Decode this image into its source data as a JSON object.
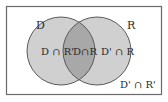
{
  "diagram": {
    "type": "venn",
    "sets": [
      {
        "name": "D",
        "label": "D"
      },
      {
        "name": "R",
        "label": "R"
      }
    ],
    "regions": {
      "d_only": "D ∩ R'",
      "intersection": "D∩R",
      "r_only": "D' ∩ R",
      "outside": "D' ∩ R'"
    },
    "colors": {
      "circle_fill": "#d0d0d0",
      "intersection_fill": "#a8a8a8",
      "stroke": "#5a5a5a",
      "border": "#6a6a6a",
      "background": "#ffffff"
    }
  }
}
